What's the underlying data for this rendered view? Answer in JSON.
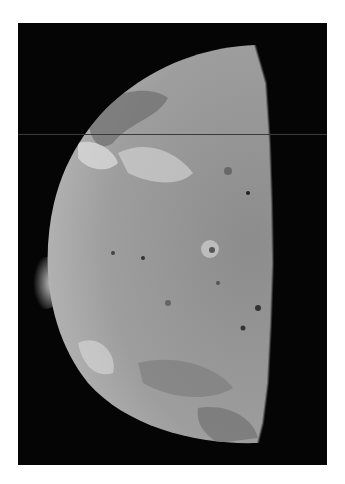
{
  "image": {
    "subject": "Io, crescent/half-lit moon with volcanic plume on the limb",
    "colors": {
      "background": "#ffffff",
      "space": "#050505",
      "surface": "#9a9a9a",
      "surface_light": "#cfcfcf",
      "surface_dark": "#6a6a6a",
      "plume": "#bdbdbd"
    }
  }
}
